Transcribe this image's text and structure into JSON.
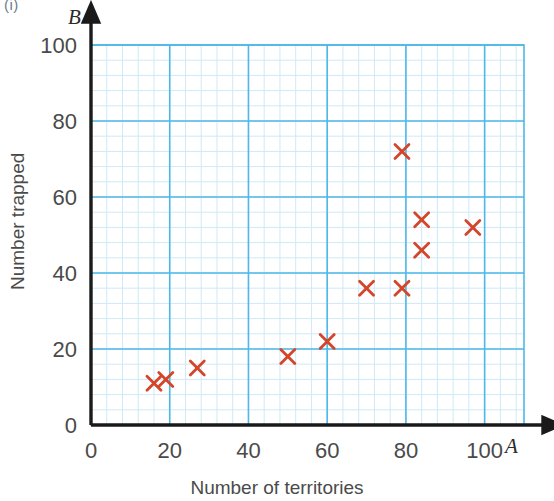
{
  "figure": {
    "label": "(i)"
  },
  "axes": {
    "y_variable": "B",
    "x_variable": "A",
    "y_title": "Number trapped",
    "x_title": "Number of territories"
  },
  "colors": {
    "marker": "#d4452a",
    "grid_major": "#4db8e8",
    "grid_minor": "#cfe9f7",
    "axis": "#1a1a1a",
    "tick_text": "#4a4a4a"
  },
  "chart_data": {
    "type": "scatter",
    "title": "",
    "xlabel": "Number of territories",
    "ylabel": "Number trapped",
    "x_axis_variable": "A",
    "y_axis_variable": "B",
    "xlim": [
      0,
      110
    ],
    "ylim": [
      0,
      100
    ],
    "xticks": [
      0,
      20,
      40,
      60,
      80,
      100
    ],
    "yticks": [
      0,
      20,
      40,
      60,
      80,
      100
    ],
    "grid": true,
    "grid_major_step": 20,
    "grid_minor_step": 4,
    "legend": null,
    "marker": "x",
    "points": [
      {
        "x": 16,
        "y": 11
      },
      {
        "x": 19,
        "y": 12
      },
      {
        "x": 27,
        "y": 15
      },
      {
        "x": 50,
        "y": 18
      },
      {
        "x": 60,
        "y": 22
      },
      {
        "x": 70,
        "y": 36
      },
      {
        "x": 79,
        "y": 36
      },
      {
        "x": 79,
        "y": 72
      },
      {
        "x": 84,
        "y": 54
      },
      {
        "x": 84,
        "y": 46
      },
      {
        "x": 97,
        "y": 52
      }
    ]
  }
}
